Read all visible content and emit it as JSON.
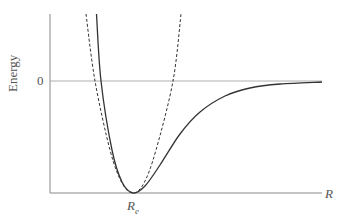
{
  "chart_data": {
    "type": "line",
    "title": "",
    "xlabel": "R",
    "ylabel": "Energy",
    "x_tick_labels": [
      "R_e"
    ],
    "y_tick_labels": [
      "0"
    ],
    "grid": false,
    "legend": null,
    "series": [
      {
        "name": "Morse potential",
        "style": "solid",
        "description": "Anharmonic potential energy curve with minimum at R_e, steep repulsive wall at small R, approaching 0 (dissociation) at large R",
        "points_px": [
          [
            96.5,
            14
          ],
          [
            101,
            81
          ],
          [
            112,
            150
          ],
          [
            122,
            182
          ],
          [
            133,
            193
          ],
          [
            145,
            186
          ],
          [
            160,
            165
          ],
          [
            180,
            134
          ],
          [
            200,
            112
          ],
          [
            225,
            96
          ],
          [
            250,
            88
          ],
          [
            280,
            84
          ],
          [
            322,
            82
          ]
        ]
      },
      {
        "name": "Harmonic approximation",
        "style": "dashed",
        "description": "Parabola sharing the minimum at R_e",
        "points_px": [
          [
            86,
            14
          ],
          [
            95,
            81
          ],
          [
            110,
            150
          ],
          [
            122,
            183
          ],
          [
            133,
            193
          ],
          [
            144,
            183
          ],
          [
            156,
            150
          ],
          [
            173,
            81
          ],
          [
            181,
            14
          ]
        ]
      }
    ],
    "reference_lines": [
      {
        "name": "zero energy",
        "y_label": "0"
      }
    ]
  },
  "labels": {
    "y_axis": "Energy",
    "zero_tick": "0",
    "x_axis": "R",
    "re_main": "R",
    "re_sub": "e"
  },
  "colors": {
    "axis": "#888888",
    "curve": "#333333",
    "text": "#555555"
  }
}
